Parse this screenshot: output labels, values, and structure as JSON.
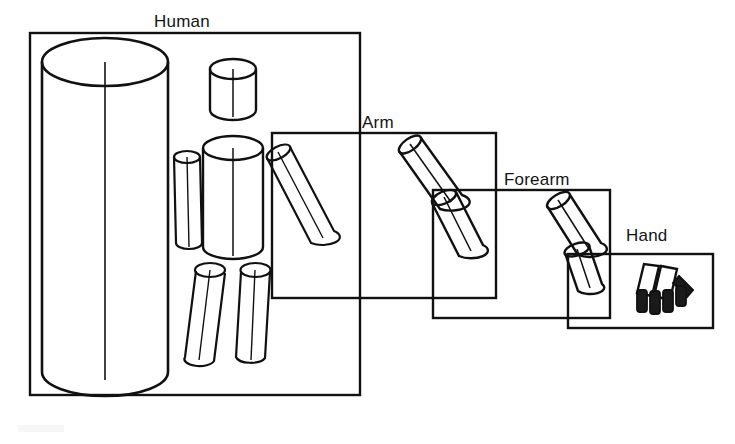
{
  "figure": {
    "title_visible": false,
    "background_color": "#ffffff",
    "stroke_color": "#111111",
    "fill_color": "#ffffff",
    "finger_fill_color": "#1a1a1a"
  },
  "labels": {
    "human": "Human",
    "arm": "Arm",
    "forearm": "Forearm",
    "hand": "Hand"
  },
  "boxes": [
    {
      "name": "Human",
      "x": 30,
      "y": 33,
      "w": 330,
      "h": 362
    },
    {
      "name": "Arm",
      "x": 272,
      "y": 133,
      "w": 224,
      "h": 165
    },
    {
      "name": "Forearm",
      "x": 433,
      "y": 190,
      "w": 177,
      "h": 128
    },
    {
      "name": "Hand",
      "x": 568,
      "y": 254,
      "w": 145,
      "h": 74
    }
  ],
  "parts": {
    "human": [
      "bounding-cylinder",
      "head",
      "torso",
      "left-upper-arm",
      "right-upper-arm",
      "right-forearm",
      "left-leg",
      "right-leg"
    ],
    "arm": [
      "upper-arm-cylinder",
      "forearm-cylinder"
    ],
    "forearm": [
      "forearm-cylinder",
      "hand-cylinder"
    ],
    "hand": [
      "palm-plate-a",
      "palm-plate-b",
      "thumb",
      "finger-1",
      "finger-2",
      "finger-3",
      "finger-4"
    ]
  },
  "hierarchy": {
    "root": "Human",
    "chain": [
      "Human",
      "Arm",
      "Forearm",
      "Hand"
    ]
  },
  "caption": ""
}
